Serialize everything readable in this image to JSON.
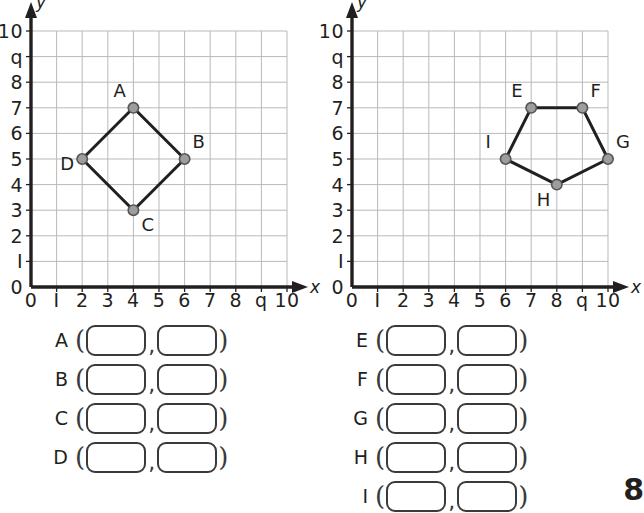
{
  "page": {
    "page_number": "8",
    "background": "#ffffff",
    "ink": "#231f20"
  },
  "style": {
    "grid_line_color": "#b9b9b9",
    "axis_color": "#231f20",
    "polygon_stroke": "#231f20",
    "point_fill": "#9d9d9d",
    "point_stroke": "#555555",
    "box_border": "#3a3a3a"
  },
  "grids": [
    {
      "id": "left",
      "axis_x_label": "x",
      "axis_y_label": "y",
      "x_ticks": [
        "0",
        "I",
        "2",
        "3",
        "4",
        "5",
        "6",
        "7",
        "8",
        "q",
        "10"
      ],
      "y_ticks": [
        "10",
        "q",
        "8",
        "7",
        "6",
        "5",
        "4",
        "3",
        "2",
        "I",
        "0"
      ],
      "x_range": [
        0,
        10
      ],
      "y_range": [
        0,
        10
      ],
      "shape": "quadrilateral",
      "points": [
        {
          "label": "A",
          "x": 4,
          "y": 7,
          "label_pos": "above-left"
        },
        {
          "label": "B",
          "x": 6,
          "y": 5,
          "label_pos": "above-right"
        },
        {
          "label": "C",
          "x": 4,
          "y": 3,
          "label_pos": "below-right"
        },
        {
          "label": "D",
          "x": 2,
          "y": 5,
          "label_pos": "left-below"
        }
      ]
    },
    {
      "id": "right",
      "axis_x_label": "x",
      "axis_y_label": "y",
      "x_ticks": [
        "0",
        "I",
        "2",
        "3",
        "4",
        "5",
        "6",
        "7",
        "8",
        "q",
        "10"
      ],
      "y_ticks": [
        "10",
        "q",
        "8",
        "7",
        "6",
        "5",
        "4",
        "3",
        "2",
        "I",
        "0"
      ],
      "x_range": [
        0,
        10
      ],
      "y_range": [
        0,
        10
      ],
      "shape": "pentagon",
      "points": [
        {
          "label": "E",
          "x": 7,
          "y": 7,
          "label_pos": "above-left"
        },
        {
          "label": "F",
          "x": 9,
          "y": 7,
          "label_pos": "above-right"
        },
        {
          "label": "G",
          "x": 10,
          "y": 5,
          "label_pos": "above-right"
        },
        {
          "label": "H",
          "x": 8,
          "y": 4,
          "label_pos": "below-left"
        },
        {
          "label": "I",
          "x": 6,
          "y": 5,
          "label_pos": "above-left"
        }
      ]
    }
  ],
  "answers": {
    "open_paren": "(",
    "comma": ",",
    "close_paren": ")",
    "left_column": [
      {
        "letter": "A",
        "x_value": "",
        "y_value": ""
      },
      {
        "letter": "B",
        "x_value": "",
        "y_value": ""
      },
      {
        "letter": "C",
        "x_value": "",
        "y_value": ""
      },
      {
        "letter": "D",
        "x_value": "",
        "y_value": ""
      }
    ],
    "right_column": [
      {
        "letter": "E",
        "x_value": "",
        "y_value": ""
      },
      {
        "letter": "F",
        "x_value": "",
        "y_value": ""
      },
      {
        "letter": "G",
        "x_value": "",
        "y_value": ""
      },
      {
        "letter": "H",
        "x_value": "",
        "y_value": ""
      },
      {
        "letter": "I",
        "x_value": "",
        "y_value": ""
      }
    ]
  }
}
